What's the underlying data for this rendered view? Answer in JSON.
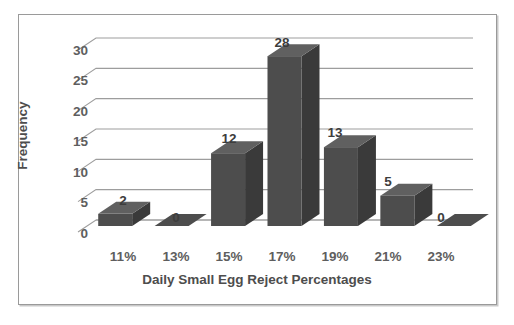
{
  "chart_data": {
    "type": "bar",
    "title": "",
    "xlabel": "Daily Small Egg Reject Percentages",
    "ylabel": "Frequency",
    "categories": [
      "11%",
      "13%",
      "15%",
      "17%",
      "19%",
      "21%",
      "23%"
    ],
    "values": [
      2,
      0,
      12,
      28,
      13,
      5,
      0
    ],
    "value_labels": [
      "2",
      "0",
      "12",
      "28",
      "13",
      "5",
      "0"
    ],
    "yticks": [
      0,
      5,
      10,
      15,
      20,
      25,
      30
    ],
    "ytick_labels": [
      "0",
      "5",
      "10",
      "15",
      "20",
      "25",
      "30"
    ],
    "ylim": [
      0,
      32
    ],
    "grid": true,
    "grid_axis": "y",
    "legend": false,
    "style": "3d-column",
    "colors": {
      "bar_front": "#4d4d4d",
      "bar_side": "#3a3a3a",
      "bar_top": "#606060",
      "gridline": "#9d9d9d",
      "axis_line": "#9d9d9d",
      "frame": "#9a9a9a",
      "tick_text": "#5e5e5e",
      "title_text": "#4d4d4d",
      "background": "#ffffff"
    }
  },
  "axes": {
    "y_title": "Frequency",
    "x_title": "Daily Small Egg Reject Percentages"
  },
  "ticks": {
    "y": [
      "30",
      "25",
      "20",
      "15",
      "10",
      "5",
      "0"
    ],
    "x": [
      "11%",
      "13%",
      "15%",
      "17%",
      "19%",
      "21%",
      "23%"
    ]
  },
  "bar_labels": [
    "2",
    "0",
    "12",
    "28",
    "13",
    "5",
    "0"
  ]
}
